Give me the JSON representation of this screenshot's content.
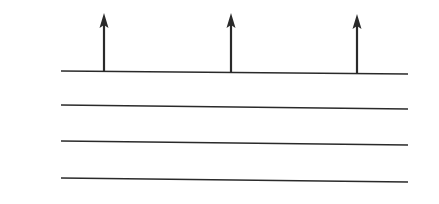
{
  "diagram": {
    "line_color": "#2a2a2a",
    "background": "#ffffff",
    "lines": [
      {
        "x1": 61,
        "y1": 71,
        "x2": 408,
        "y2": 74
      },
      {
        "x1": 61,
        "y1": 105,
        "x2": 408,
        "y2": 109
      },
      {
        "x1": 61,
        "y1": 141,
        "x2": 408,
        "y2": 145
      },
      {
        "x1": 61,
        "y1": 178,
        "x2": 408,
        "y2": 182
      }
    ],
    "arrows": [
      {
        "x": 104,
        "y_base": 72,
        "y_tip": 13
      },
      {
        "x": 231,
        "y_base": 73,
        "y_tip": 13
      },
      {
        "x": 357,
        "y_base": 74,
        "y_tip": 14
      }
    ]
  }
}
